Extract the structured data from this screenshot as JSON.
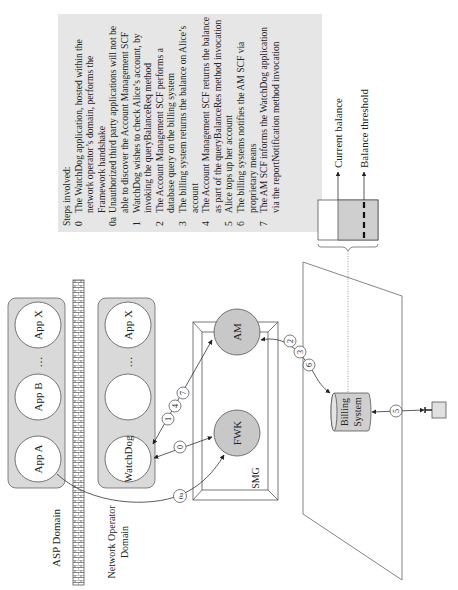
{
  "domains": {
    "asp": "ASP Domain",
    "network_operator_line1": "Network Operator",
    "network_operator_line2": "Domain"
  },
  "asp_apps": [
    "App A",
    "App B",
    "…",
    "App X"
  ],
  "operator_apps": [
    "WatchDog",
    "",
    "…",
    "App X"
  ],
  "smg": {
    "label": "SMG",
    "nodes": {
      "am": "AM",
      "fwk": "FWK"
    }
  },
  "billing": {
    "line1": "Billing",
    "line2": "System"
  },
  "balance": {
    "current": "Current balance",
    "threshold": "Balance threshold"
  },
  "step_markers": {
    "s0": "0",
    "s0a": "0a",
    "s1": "1",
    "s2": "2",
    "s3": "3",
    "s4": "4",
    "s5": "5",
    "s6": "6",
    "s7": "7"
  },
  "steps": {
    "heading": "Steps involved:",
    "items": [
      {
        "num": "0",
        "lines": [
          "The WatchDog application, hosted within the",
          "network operator’s domain, performs the",
          "Framework handshake"
        ]
      },
      {
        "num": "0a",
        "lines": [
          "Unauthorized third party applications will not be",
          "able to discover the Account Management SCF"
        ]
      },
      {
        "num": "1",
        "lines": [
          "WatchDog wishes to check Alice’s account, by",
          "invoking the queryBalanceReq method"
        ]
      },
      {
        "num": "2",
        "lines": [
          "The Account Management SCF performs a",
          "database query on the billing system"
        ]
      },
      {
        "num": "3",
        "lines": [
          "The billing system returns the balance on Alice’s",
          "account"
        ]
      },
      {
        "num": "4",
        "lines": [
          "The Account Management SCF returns the balance",
          "as part of the queryBalanceRes method invocation"
        ]
      },
      {
        "num": "5",
        "lines": [
          "Alice tops up her account"
        ]
      },
      {
        "num": "6",
        "lines": [
          "The billing systems notifies the AM SCF via",
          "proprietary means"
        ]
      },
      {
        "num": "7",
        "lines": [
          "The AM SCF informs the WatchDog application",
          "via the reportNotification method invocation"
        ]
      }
    ]
  },
  "colors": {
    "container_fill": "#d9d9d9",
    "node_fill": "#c8c8c8",
    "textbox_fill": "#e6e6e6",
    "stroke": "#555555"
  }
}
